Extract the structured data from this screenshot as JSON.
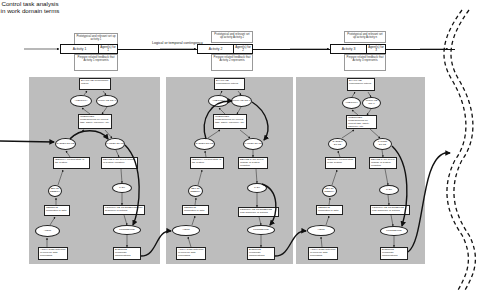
{
  "title": "Control task analysis in work domain terms",
  "contingency_label": "Logical or temporal contingency",
  "activities": [
    {
      "name": "Activity 1",
      "agent": "Agent(s) for 1",
      "note_top": "Prototypical and relevant set up activity 1",
      "note_bottom": "Prepare related feedback that Activity 1 represents"
    },
    {
      "name": "Activity 2",
      "agent": "Agent(s) for 2",
      "note_top": "Prototypical and relevant set up activity Activity 2",
      "note_bottom": "Prepare related feedback that Activity 2 represents"
    },
    {
      "name": "Activity 3",
      "agent": "Agent(s) for 3",
      "note_top": "Prototypical and relevant set up activity Activity n",
      "note_bottom": "Prepare related feedback that Activity 3 represents"
    }
  ],
  "ladder": {
    "evaluate": "EVALUATE performance criteria",
    "ambiguity": "AMBIGUITY",
    "ultimate_goal": "ULTIMATE GOAL",
    "interpret": "INTERPRET consequences for current task, safety, efficiency, etc.",
    "system_state": "SYSTEM STATE",
    "target_state": "TARGET STATE",
    "identify": "IDENTIFY present state of the system",
    "define_task": "DEFINE TASK select change of system condition",
    "observations": "SET OF OBSERV.",
    "task": "TASK",
    "observe": "OBSERVE information & data",
    "formulate": "FORMULATE PROCEDURE plan sequence of actions",
    "alert": "ALERT",
    "procedure": "PROCEDURE",
    "activation": "ACTIVATION detection of need for data processing",
    "execute": "EXECUTE coordinate manipulations"
  },
  "colors": {
    "panel": "#bdbdbd",
    "line": "#111111",
    "node_fill": "#ffffff"
  }
}
